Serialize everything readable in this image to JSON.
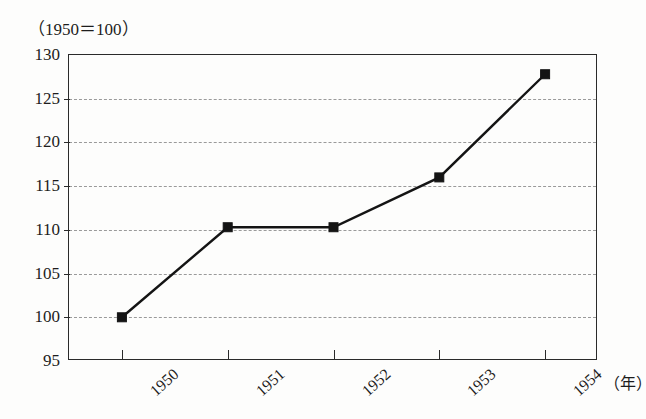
{
  "chart_data": {
    "type": "line",
    "title": "（1950＝100）",
    "xlabel": "（年）",
    "ylabel": "",
    "categories": [
      "1950",
      "1951",
      "1952",
      "1953",
      "1954"
    ],
    "values": [
      100.0,
      110.3,
      110.3,
      116.0,
      127.8
    ],
    "series": [
      {
        "name": "index",
        "values": [
          100.0,
          110.3,
          110.3,
          116.0,
          127.8
        ]
      }
    ],
    "ylim": [
      95,
      130
    ],
    "yticks": [
      130,
      125,
      120,
      115,
      110,
      105,
      100,
      95
    ],
    "ytick_labels": [
      "130",
      "125",
      "120",
      "115",
      "110",
      "105",
      "100",
      "95"
    ],
    "xtick_labels": [
      "1950",
      "1951",
      "1952",
      "1953",
      "1954"
    ],
    "grid": "horizontal-dashed",
    "legend": "none",
    "marker": "square",
    "line_color": "#141414",
    "grid_color": "#9a9a9a",
    "frame_color": "#2a2a2a",
    "background_color": "#fdfdfc"
  },
  "labels": {
    "index_note": "（1950＝100）",
    "x_unit": "（年）"
  }
}
